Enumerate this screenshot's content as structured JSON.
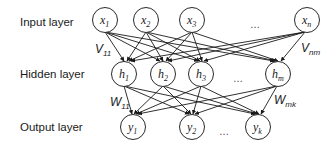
{
  "diagram": {
    "type": "neural-network",
    "layers": [
      {
        "label": "Input layer",
        "nodes": [
          {
            "base": "x",
            "sub": "1"
          },
          {
            "base": "x",
            "sub": "2"
          },
          {
            "base": "x",
            "sub": "3"
          },
          {
            "base": "x",
            "sub": "n"
          }
        ],
        "ellipsis": "…"
      },
      {
        "label": "Hidden layer",
        "nodes": [
          {
            "base": "h",
            "sub": "1"
          },
          {
            "base": "h",
            "sub": "2"
          },
          {
            "base": "h",
            "sub": "3"
          },
          {
            "base": "h",
            "sub": "m"
          }
        ],
        "ellipsis": "…"
      },
      {
        "label": "Output layer",
        "nodes": [
          {
            "base": "y",
            "sub": "1"
          },
          {
            "base": "y",
            "sub": "2"
          },
          {
            "base": "y",
            "sub": "k"
          }
        ],
        "ellipsis": "…"
      }
    ],
    "weights": {
      "v_first": {
        "base": "V",
        "sub": "11"
      },
      "v_last": {
        "base": "V",
        "sub": "nm"
      },
      "w_first": {
        "base": "W",
        "sub": "11"
      },
      "w_last": {
        "base": "W",
        "sub": "mk"
      }
    },
    "colors": {
      "stroke": "#1a1a1a",
      "node_fill": "#ffffff",
      "text": "#1a1a1a"
    }
  }
}
